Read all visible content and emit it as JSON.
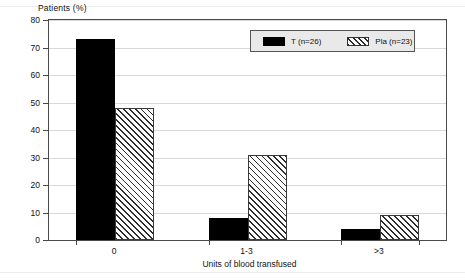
{
  "chart_data": {
    "type": "bar",
    "title": "",
    "ylabel": "Patients (%)",
    "xlabel": "Units of blood transfused",
    "categories": [
      "0",
      "1-3",
      ">3"
    ],
    "series": [
      {
        "name": "T (n=26)",
        "values": [
          73,
          8,
          4
        ],
        "style": "solid-black"
      },
      {
        "name": "Pla (n=23)",
        "values": [
          48,
          31,
          9
        ],
        "style": "diagonal-hatch"
      }
    ],
    "ylim": [
      0,
      80
    ],
    "yticks": [
      0,
      10,
      20,
      30,
      40,
      50,
      60,
      70,
      80
    ],
    "ytick_labels": [
      "0",
      "10",
      "20",
      "30",
      "40",
      "50",
      "60",
      "70",
      "80"
    ],
    "grid": true,
    "legend_position": "top-right"
  },
  "legend": {
    "entries": [
      {
        "label": "T (n=26)",
        "swatch": "solid-black-swatch"
      },
      {
        "label": "Pla (n=23)",
        "swatch": "hatched-swatch"
      }
    ]
  },
  "colors": {
    "series_t": "#000000",
    "series_pla_hatch": "#2b2b2b",
    "axis": "#4a4a4a",
    "grid": "#d8d8d8",
    "legend_background": "#e9e9e9"
  }
}
